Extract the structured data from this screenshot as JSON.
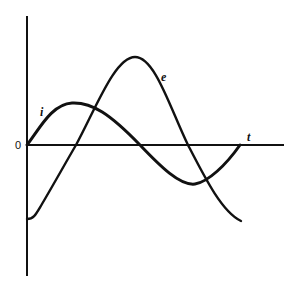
{
  "diagram": {
    "title": "",
    "colors": {
      "stroke": "#111111",
      "background": "#ffffff"
    },
    "axes": {
      "origin_label": "0",
      "horizontal_label": "t",
      "vertical_label": ""
    },
    "curves": [
      {
        "id": "i",
        "label": "i",
        "description": "current waveform, lower amplitude, leading"
      },
      {
        "id": "e",
        "label": "e",
        "description": "voltage waveform, higher amplitude, lagging"
      }
    ]
  }
}
